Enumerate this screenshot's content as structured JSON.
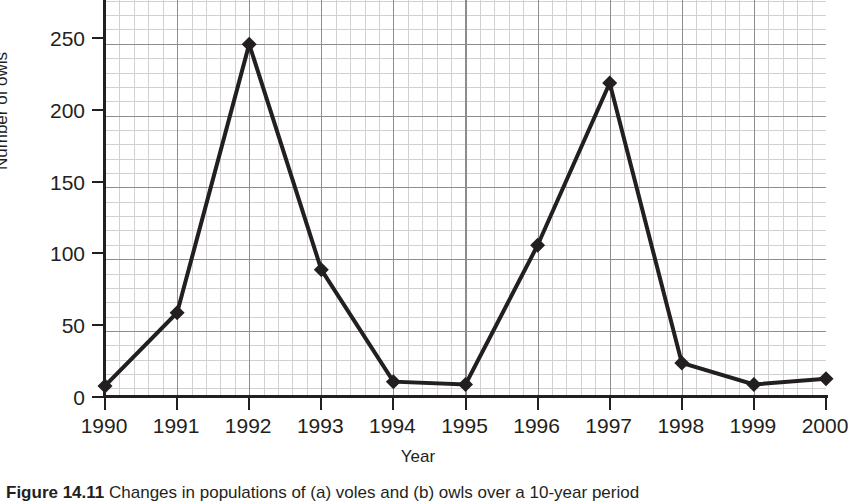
{
  "chart_data": {
    "type": "line",
    "title": "",
    "xlabel": "Year",
    "ylabel": "Number of owls",
    "x": [
      1990,
      1991,
      1992,
      1993,
      1994,
      1995,
      1996,
      1997,
      1998,
      1999,
      2000
    ],
    "categories": [
      "1990",
      "1991",
      "1992",
      "1993",
      "1994",
      "1995",
      "1996",
      "1997",
      "1998",
      "1999",
      "2000"
    ],
    "values": [
      7,
      58,
      245,
      88,
      10,
      8,
      105,
      218,
      23,
      8,
      12
    ],
    "series": [
      {
        "name": "Number of owls",
        "values": [
          7,
          58,
          245,
          88,
          10,
          8,
          105,
          218,
          23,
          8,
          12
        ]
      }
    ],
    "xlim": [
      1990,
      2000
    ],
    "ylim": [
      0,
      270
    ],
    "ytick_labels": [
      "0",
      "50",
      "100",
      "150",
      "200",
      "250"
    ],
    "yticks": [
      0,
      50,
      100,
      150,
      200,
      250
    ],
    "xtick_labels": [
      "1990",
      "1991",
      "1992",
      "1993",
      "1994",
      "1995",
      "1996",
      "1997",
      "1998",
      "1999",
      "2000"
    ],
    "grid": true,
    "minor_grid": true,
    "legend": "none",
    "marker": "diamond",
    "line_color": "#231f20",
    "marker_color": "#231f20",
    "grid_major_color": "#8c8c90",
    "grid_minor_color": "#c9c9cc"
  },
  "caption": {
    "label": "Figure 14.11",
    "text": " Changes in populations of (a) voles and (b) owls over a 10-year period"
  }
}
